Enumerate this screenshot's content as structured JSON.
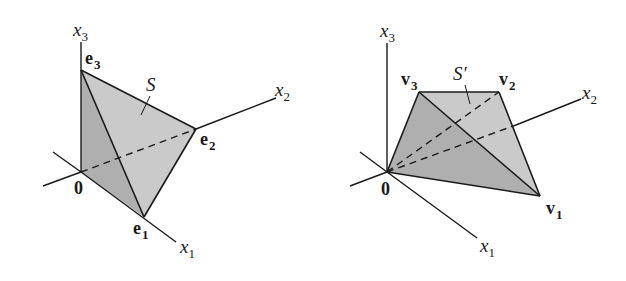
{
  "figures": [
    {
      "id": "left",
      "region_label": "S",
      "origin_label": "0",
      "axes": [
        {
          "name": "x",
          "sub": "1"
        },
        {
          "name": "x",
          "sub": "2"
        },
        {
          "name": "x",
          "sub": "3"
        }
      ],
      "vertices": [
        {
          "name": "e",
          "sub": "1"
        },
        {
          "name": "e",
          "sub": "2"
        },
        {
          "name": "e",
          "sub": "3"
        }
      ]
    },
    {
      "id": "right",
      "region_label": "S′",
      "origin_label": "0",
      "axes": [
        {
          "name": "x",
          "sub": "1"
        },
        {
          "name": "x",
          "sub": "2"
        },
        {
          "name": "x",
          "sub": "3"
        }
      ],
      "vertices": [
        {
          "name": "v",
          "sub": "1"
        },
        {
          "name": "v",
          "sub": "2"
        },
        {
          "name": "v",
          "sub": "3"
        }
      ]
    }
  ],
  "colors": {
    "light_face": "#cacaca",
    "dark_face": "#afafaf",
    "line": "#1a1a1a"
  }
}
